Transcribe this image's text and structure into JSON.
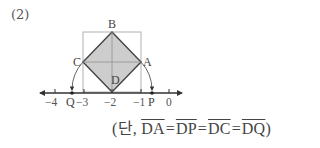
{
  "problem": {
    "number": "(2)"
  },
  "diagram": {
    "points": {
      "A": "A",
      "B": "B",
      "C": "C",
      "D": "D",
      "P": "P",
      "Q": "Q"
    },
    "axis_ticks": [
      {
        "value": -4,
        "label": "−4"
      },
      {
        "value": -3,
        "label": "−3"
      },
      {
        "value": -2,
        "label": "−2"
      },
      {
        "value": -1,
        "label": "−1"
      },
      {
        "value": 0,
        "label": "0"
      }
    ],
    "colors": {
      "square_fill": "#c4c4c4",
      "square_stroke": "#444444",
      "guide_stroke": "#b0b0b0",
      "axis_stroke": "#333333"
    }
  },
  "caption": {
    "prefix": "(단, ",
    "segments": [
      "DA",
      "DP",
      "DC",
      "DQ"
    ],
    "equals": "=",
    "suffix": ")"
  }
}
